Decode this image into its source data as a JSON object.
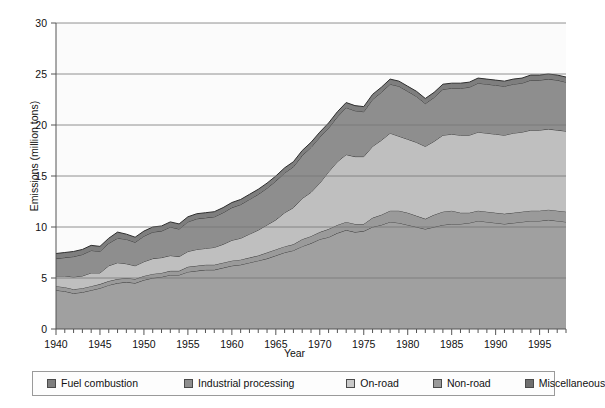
{
  "chart_data": {
    "type": "area",
    "stacked": true,
    "title": "",
    "xlabel": "Year",
    "ylabel": "Emissions (million tons)",
    "xlim": [
      1940,
      1998
    ],
    "ylim": [
      0,
      30
    ],
    "yticks": [
      0,
      5,
      10,
      15,
      20,
      25,
      30
    ],
    "xticks": [
      1940,
      1945,
      1950,
      1955,
      1960,
      1965,
      1970,
      1975,
      1980,
      1985,
      1990,
      1995
    ],
    "xtick_labels": [
      "1940",
      "1945",
      "1950",
      "1955",
      "1960",
      "1965",
      "1970",
      "1975",
      "1980",
      "1985",
      "1990",
      "1995"
    ],
    "ytick_labels": [
      "0",
      "5",
      "10",
      "15",
      "20",
      "25",
      "30"
    ],
    "minor_xtick_interval": 1,
    "grid": "horizontal",
    "legend_position": "below",
    "plot_background": "#fbfbfb",
    "x": [
      1940,
      1941,
      1942,
      1943,
      1944,
      1945,
      1946,
      1947,
      1948,
      1949,
      1950,
      1951,
      1952,
      1953,
      1954,
      1955,
      1956,
      1957,
      1958,
      1959,
      1960,
      1961,
      1962,
      1963,
      1964,
      1965,
      1966,
      1967,
      1968,
      1969,
      1970,
      1971,
      1972,
      1973,
      1974,
      1975,
      1976,
      1977,
      1978,
      1979,
      1980,
      1981,
      1982,
      1983,
      1984,
      1985,
      1986,
      1987,
      1988,
      1989,
      1990,
      1991,
      1992,
      1993,
      1994,
      1995,
      1996,
      1997,
      1998
    ],
    "series": [
      {
        "name": "On-road",
        "color": "#a0a0a0",
        "edge": "#3c3c3c",
        "order": 1,
        "values": [
          3.8,
          3.7,
          3.5,
          3.6,
          3.8,
          4.0,
          4.3,
          4.5,
          4.6,
          4.5,
          4.8,
          5.0,
          5.1,
          5.3,
          5.3,
          5.6,
          5.7,
          5.8,
          5.8,
          6.0,
          6.2,
          6.3,
          6.5,
          6.7,
          6.9,
          7.2,
          7.5,
          7.7,
          8.1,
          8.4,
          8.8,
          9.0,
          9.4,
          9.7,
          9.5,
          9.6,
          10.0,
          10.2,
          10.5,
          10.4,
          10.2,
          10.0,
          9.8,
          10.0,
          10.2,
          10.3,
          10.3,
          10.4,
          10.6,
          10.5,
          10.4,
          10.3,
          10.4,
          10.5,
          10.6,
          10.6,
          10.7,
          10.6,
          10.5
        ]
      },
      {
        "name": "Non-road",
        "color": "#9a9a9a",
        "edge": "#3c3c3c",
        "order": 2,
        "values": [
          0.4,
          0.4,
          0.4,
          0.4,
          0.4,
          0.4,
          0.4,
          0.4,
          0.4,
          0.4,
          0.4,
          0.4,
          0.4,
          0.4,
          0.4,
          0.5,
          0.5,
          0.5,
          0.5,
          0.5,
          0.5,
          0.5,
          0.5,
          0.5,
          0.6,
          0.6,
          0.6,
          0.6,
          0.7,
          0.7,
          0.7,
          0.8,
          0.8,
          0.8,
          0.8,
          0.7,
          0.9,
          1.0,
          1.1,
          1.2,
          1.2,
          1.1,
          1.0,
          1.2,
          1.3,
          1.3,
          1.1,
          1.0,
          1.0,
          1.0,
          1.0,
          1.0,
          1.0,
          1.0,
          1.0,
          1.0,
          1.0,
          1.0,
          1.0
        ]
      },
      {
        "name": "Miscellaneous",
        "color": "#bfbfbf",
        "edge": "#3c3c3c",
        "order": 3,
        "values": [
          1.0,
          1.1,
          1.2,
          1.2,
          1.3,
          1.1,
          1.5,
          1.6,
          1.4,
          1.3,
          1.4,
          1.5,
          1.5,
          1.5,
          1.4,
          1.5,
          1.6,
          1.6,
          1.7,
          1.8,
          2.0,
          2.1,
          2.3,
          2.5,
          2.7,
          2.9,
          3.3,
          3.6,
          4.0,
          4.3,
          4.8,
          5.6,
          6.2,
          6.6,
          6.6,
          6.6,
          7.0,
          7.3,
          7.6,
          7.3,
          7.2,
          7.2,
          7.1,
          7.2,
          7.5,
          7.5,
          7.6,
          7.6,
          7.7,
          7.7,
          7.7,
          7.7,
          7.8,
          7.8,
          7.9,
          7.9,
          7.9,
          7.9,
          7.9
        ]
      },
      {
        "name": "Industrial processing",
        "color": "#8e8e8e",
        "edge": "#3c3c3c",
        "order": 4,
        "values": [
          1.7,
          1.8,
          2.0,
          2.1,
          2.2,
          2.1,
          2.2,
          2.4,
          2.4,
          2.3,
          2.5,
          2.6,
          2.6,
          2.8,
          2.7,
          2.9,
          3.0,
          3.0,
          3.0,
          3.1,
          3.2,
          3.3,
          3.4,
          3.5,
          3.6,
          3.8,
          3.9,
          4.0,
          4.2,
          4.4,
          4.5,
          4.3,
          4.4,
          4.6,
          4.5,
          4.4,
          4.6,
          4.7,
          4.8,
          4.9,
          4.7,
          4.5,
          4.2,
          4.3,
          4.5,
          4.5,
          4.6,
          4.7,
          4.8,
          4.8,
          4.8,
          4.8,
          4.8,
          4.8,
          4.9,
          4.9,
          4.9,
          4.9,
          4.8
        ]
      },
      {
        "name": "Fuel combustion",
        "color": "#7e7e7e",
        "edge": "#2e2e2e",
        "order": 5,
        "values": [
          0.5,
          0.5,
          0.5,
          0.5,
          0.5,
          0.5,
          0.5,
          0.6,
          0.5,
          0.5,
          0.5,
          0.5,
          0.5,
          0.5,
          0.5,
          0.5,
          0.5,
          0.5,
          0.5,
          0.5,
          0.5,
          0.5,
          0.5,
          0.5,
          0.5,
          0.5,
          0.5,
          0.5,
          0.5,
          0.5,
          0.5,
          0.5,
          0.5,
          0.5,
          0.5,
          0.5,
          0.5,
          0.5,
          0.5,
          0.5,
          0.5,
          0.5,
          0.5,
          0.5,
          0.5,
          0.5,
          0.5,
          0.5,
          0.5,
          0.5,
          0.5,
          0.5,
          0.5,
          0.5,
          0.5,
          0.5,
          0.5,
          0.5,
          0.5
        ]
      }
    ],
    "totals": [
      7.4,
      7.5,
      7.6,
      7.8,
      8.2,
      8.1,
      8.9,
      9.5,
      9.3,
      9.0,
      9.6,
      10.0,
      10.1,
      10.5,
      10.3,
      11.0,
      11.3,
      11.4,
      11.5,
      11.9,
      12.4,
      12.7,
      13.2,
      13.7,
      14.3,
      15.0,
      15.8,
      16.4,
      17.5,
      18.3,
      19.3,
      20.2,
      21.3,
      22.2,
      21.9,
      21.8,
      23.0,
      23.7,
      24.5,
      24.3,
      23.8,
      23.3,
      22.6,
      23.2,
      24.0,
      24.1,
      24.1,
      24.2,
      24.6,
      24.5,
      24.4,
      24.3,
      24.5,
      24.6,
      24.9,
      24.9,
      25.0,
      24.9,
      24.7
    ]
  },
  "legend": {
    "items": [
      {
        "label": "Fuel combustion",
        "color": "#7e7e7e"
      },
      {
        "label": "Industrial processing",
        "color": "#8e8e8e"
      },
      {
        "label": "On-road",
        "color": "#c9c9c9"
      },
      {
        "label": "Non-road",
        "color": "#9a9a9a"
      },
      {
        "label": "Miscellaneous",
        "color": "#6f6f6f"
      }
    ]
  },
  "axes": {
    "x_title": "Year",
    "y_title": "Emissions (million tons)"
  }
}
